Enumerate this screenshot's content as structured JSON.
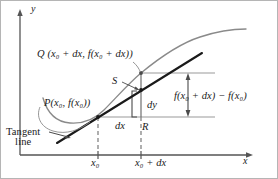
{
  "figure": {
    "type": "calculus-differential-diagram",
    "axes": {
      "y_axis_label": "y",
      "x_axis_label": "x",
      "x_axis_y_px": 155,
      "y_axis_x_px": 20
    },
    "points": [
      {
        "name": "P",
        "label": "P(x₀, f(x₀))",
        "label_parts": {
          "letter": "P",
          "arg1": "x",
          "sub1": "0",
          "arg2": "f(x",
          "sub2": "0",
          "tail": "))"
        },
        "px": {
          "x": 98,
          "y": 117
        },
        "description": "point of tangency on the curve"
      },
      {
        "name": "Q",
        "label": "Q (x₀ + dx, f(x₀ + dx))",
        "px": {
          "x": 141,
          "y": 73
        },
        "description": "second point on the curve at x0 + dx"
      },
      {
        "name": "S",
        "label": "S",
        "px": {
          "x": 141,
          "y": 90
        },
        "description": "point on the tangent line above x0 + dx"
      },
      {
        "name": "R",
        "label": "R",
        "px": {
          "x": 141,
          "y": 117
        },
        "description": "right-angle corner of the differential triangle"
      }
    ],
    "labels": {
      "y": "y",
      "x": "x",
      "Q": "Q",
      "P": "P",
      "S": "S",
      "R": "R",
      "dy": "dy",
      "dx": "dx",
      "difference": "f(x₀ + dx) − f(x₀)",
      "tangent_line_1": "Tangent",
      "tangent_line_2": "line"
    },
    "tick_labels": {
      "x0": "x₀",
      "x0_plus_dx": "x₀ + dx"
    },
    "annotations": [
      {
        "name": "dy-brace",
        "text": "dy",
        "meaning": "differential of y, rise along the tangent line"
      },
      {
        "name": "dx-segment",
        "text": "dx",
        "meaning": "differential of x, horizontal run"
      },
      {
        "name": "delta-f-brace",
        "text": "f(x₀ + dx) − f(x₀)",
        "meaning": "actual change in the function value"
      },
      {
        "name": "tangent-callout",
        "text": "Tangent line",
        "meaning": "arrow pointing at the straight tangent line"
      }
    ],
    "colors": {
      "curve": "#8a8a8a",
      "tangent": "#1a1a1a",
      "axis": "#555555",
      "guide": "#9a9a9a",
      "dashed": "#7a7a7a",
      "text": "#1a1a1a",
      "border": "#b5b5b5",
      "background": "#ffffff"
    },
    "geometry": {
      "x0_px": 98,
      "x0_plus_dx_px": 141,
      "baseline_fx0_px": 117,
      "upper_line_px": 73,
      "tangent_point_S_px": 90,
      "curve": "concave-down increasing curve with a local minimum near x=70",
      "tangent_slope": "approximately -0.62 in screen coords (rising to the right)"
    }
  }
}
